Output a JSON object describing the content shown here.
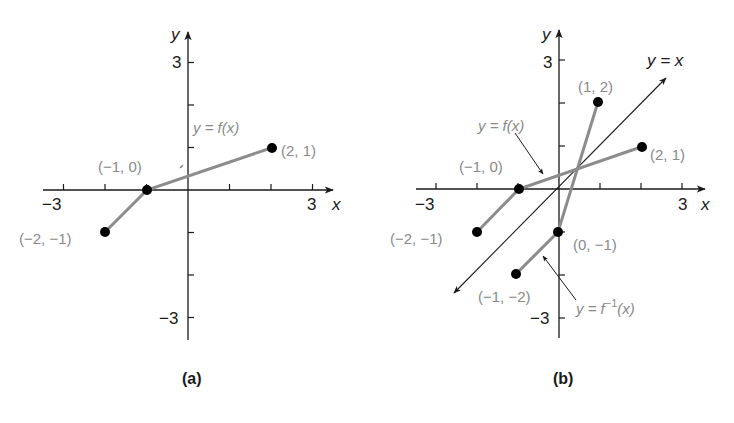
{
  "chart_data": [
    {
      "id": "a",
      "type": "line",
      "caption": "(a)",
      "x_axis_label": "x",
      "y_axis_label": "y",
      "xlim": [
        -3,
        3
      ],
      "ylim": [
        -3,
        3
      ],
      "x_tick_labels": {
        "-3": "−3",
        "3": "3"
      },
      "y_tick_labels": {
        "3": "3",
        "-3": "−3"
      },
      "grid": false,
      "series": [
        {
          "name": "y = f(x)",
          "points": [
            [
              -2,
              -1
            ],
            [
              -1,
              0
            ],
            [
              2,
              1
            ]
          ],
          "point_labels": [
            "(−2, −1)",
            "(−1, 0)",
            "(2, 1)"
          ]
        }
      ],
      "annotations": [
        {
          "text": "y = f(x)",
          "target": "segment (-1,0)-(2,1)"
        }
      ]
    },
    {
      "id": "b",
      "type": "line",
      "caption": "(b)",
      "x_axis_label": "x",
      "y_axis_label": "y",
      "xlim": [
        -3,
        3
      ],
      "ylim": [
        -3,
        3
      ],
      "x_tick_labels": {
        "-3": "−3",
        "3": "3"
      },
      "y_tick_labels": {
        "3": "3",
        "-3": "−3"
      },
      "grid": false,
      "series": [
        {
          "name": "y = f(x)",
          "points": [
            [
              -2,
              -1
            ],
            [
              -1,
              0
            ],
            [
              2,
              1
            ]
          ],
          "point_labels": [
            "(−2, −1)",
            "(−1, 0)",
            "(2, 1)"
          ]
        },
        {
          "name": "y = f⁻¹(x)",
          "points": [
            [
              -1,
              -2
            ],
            [
              0,
              -1
            ],
            [
              1,
              2
            ]
          ],
          "point_labels": [
            "(−1, −2)",
            "(0, −1)",
            "(1, 2)"
          ]
        },
        {
          "name": "y = x",
          "line": "identity",
          "range": [
            -2.5,
            2.7
          ],
          "arrows": "both"
        }
      ],
      "annotations": [
        {
          "text": "y = f(x)",
          "arrow_to": "f segment"
        },
        {
          "text": "y = f⁻¹(x)",
          "arrow_to": "inverse segment"
        },
        {
          "text": "y = x"
        }
      ]
    }
  ],
  "graphs": {
    "a": {
      "caption": "(a)",
      "xlabel": "x",
      "ylabel": "y",
      "tick_x_neg": "−3",
      "tick_x_pos": "3",
      "tick_y_pos": "3",
      "tick_y_neg": "−3",
      "f_label": "y = f(x)",
      "pt_m2m1": "(−2, −1)",
      "pt_m10": "(−1, 0)",
      "pt_21": "(2, 1)"
    },
    "b": {
      "caption": "(b)",
      "xlabel": "x",
      "ylabel": "y",
      "tick_x_neg": "−3",
      "tick_x_pos": "3",
      "tick_y_pos": "3",
      "tick_y_neg": "−3",
      "f_label": "y = f(x)",
      "identity_label": "y = x",
      "finv_label_prefix": "y = f",
      "finv_label_sup": "−1",
      "finv_label_suffix": "(x)",
      "pt_m2m1": "(−2, −1)",
      "pt_m10": "(−1, 0)",
      "pt_21": "(2, 1)",
      "pt_12": "(1, 2)",
      "pt_0m1": "(0, −1)",
      "pt_m1m2": "(−1, −2)"
    }
  },
  "colors": {
    "axis": "#1a1a1a",
    "curve": "#8c8c8c",
    "point": "#000000",
    "label": "#8a8a8a"
  }
}
